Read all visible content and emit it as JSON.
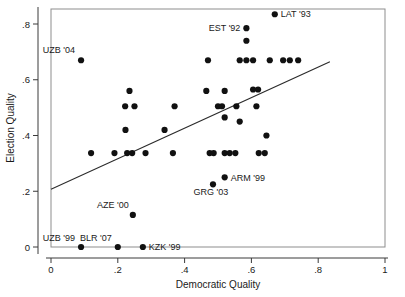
{
  "chart_data": {
    "type": "scatter",
    "title": "",
    "xlabel": "Democratic Quality",
    "ylabel": "Election Quality",
    "xlim": [
      0,
      1
    ],
    "ylim": [
      0,
      0.88
    ],
    "grid": false,
    "legend": null,
    "xticks": [
      0,
      0.2,
      0.4,
      0.6,
      0.8,
      1
    ],
    "xticklabels": [
      "0",
      ".2",
      ".4",
      ".6",
      ".8",
      "1"
    ],
    "yticks": [
      0,
      0.2,
      0.4,
      0.6,
      0.8
    ],
    "yticklabels": [
      "0",
      ".2",
      ".4",
      ".6",
      ".8"
    ],
    "points": [
      {
        "x": 0.09,
        "y": 0.67,
        "label": "UZB '04"
      },
      {
        "x": 0.09,
        "y": 0.0,
        "label": "UZB '99"
      },
      {
        "x": 0.2,
        "y": 0.0,
        "label": "BLR '07"
      },
      {
        "x": 0.275,
        "y": 0.0,
        "label": "KZK '99"
      },
      {
        "x": 0.245,
        "y": 0.115,
        "label": "AZE '00"
      },
      {
        "x": 0.485,
        "y": 0.225,
        "label": "GRG '03"
      },
      {
        "x": 0.52,
        "y": 0.25,
        "label": "ARM '99"
      },
      {
        "x": 0.585,
        "y": 0.785,
        "label": "EST '92"
      },
      {
        "x": 0.67,
        "y": 0.835,
        "label": "LAT '93"
      },
      {
        "x": 0.585,
        "y": 0.74,
        "label": ""
      },
      {
        "x": 0.47,
        "y": 0.67,
        "label": ""
      },
      {
        "x": 0.565,
        "y": 0.67,
        "label": ""
      },
      {
        "x": 0.585,
        "y": 0.67,
        "label": ""
      },
      {
        "x": 0.605,
        "y": 0.67,
        "label": ""
      },
      {
        "x": 0.655,
        "y": 0.67,
        "label": ""
      },
      {
        "x": 0.695,
        "y": 0.67,
        "label": ""
      },
      {
        "x": 0.715,
        "y": 0.67,
        "label": ""
      },
      {
        "x": 0.74,
        "y": 0.67,
        "label": ""
      },
      {
        "x": 0.235,
        "y": 0.56,
        "label": ""
      },
      {
        "x": 0.465,
        "y": 0.56,
        "label": ""
      },
      {
        "x": 0.52,
        "y": 0.56,
        "label": ""
      },
      {
        "x": 0.605,
        "y": 0.565,
        "label": ""
      },
      {
        "x": 0.62,
        "y": 0.565,
        "label": ""
      },
      {
        "x": 0.222,
        "y": 0.505,
        "label": ""
      },
      {
        "x": 0.25,
        "y": 0.505,
        "label": ""
      },
      {
        "x": 0.37,
        "y": 0.505,
        "label": ""
      },
      {
        "x": 0.5,
        "y": 0.505,
        "label": ""
      },
      {
        "x": 0.512,
        "y": 0.505,
        "label": ""
      },
      {
        "x": 0.555,
        "y": 0.505,
        "label": ""
      },
      {
        "x": 0.615,
        "y": 0.505,
        "label": ""
      },
      {
        "x": 0.52,
        "y": 0.465,
        "label": ""
      },
      {
        "x": 0.565,
        "y": 0.45,
        "label": ""
      },
      {
        "x": 0.223,
        "y": 0.42,
        "label": ""
      },
      {
        "x": 0.34,
        "y": 0.42,
        "label": ""
      },
      {
        "x": 0.645,
        "y": 0.4,
        "label": ""
      },
      {
        "x": 0.12,
        "y": 0.337,
        "label": ""
      },
      {
        "x": 0.19,
        "y": 0.337,
        "label": ""
      },
      {
        "x": 0.228,
        "y": 0.337,
        "label": ""
      },
      {
        "x": 0.243,
        "y": 0.337,
        "label": ""
      },
      {
        "x": 0.283,
        "y": 0.337,
        "label": ""
      },
      {
        "x": 0.365,
        "y": 0.337,
        "label": ""
      },
      {
        "x": 0.475,
        "y": 0.337,
        "label": ""
      },
      {
        "x": 0.487,
        "y": 0.337,
        "label": ""
      },
      {
        "x": 0.52,
        "y": 0.337,
        "label": ""
      },
      {
        "x": 0.535,
        "y": 0.337,
        "label": ""
      },
      {
        "x": 0.552,
        "y": 0.337,
        "label": ""
      },
      {
        "x": 0.622,
        "y": 0.337,
        "label": ""
      },
      {
        "x": 0.64,
        "y": 0.337,
        "label": ""
      }
    ],
    "fit_line": {
      "x0": 0.0,
      "y0": 0.207,
      "x1": 0.835,
      "y1": 0.665
    }
  }
}
